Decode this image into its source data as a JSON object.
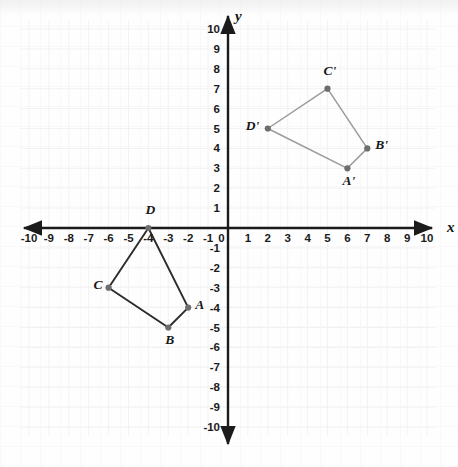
{
  "figure": {
    "kind": "coordinate-plane",
    "axis_labels": {
      "x": "x",
      "y": "y"
    },
    "x_ticks": [
      "-10",
      "-9",
      "-8",
      "-7",
      "-6",
      "-5",
      "-4",
      "-3",
      "-2",
      "-1",
      "0",
      "1",
      "2",
      "3",
      "4",
      "5",
      "6",
      "7",
      "8",
      "9",
      "10"
    ],
    "y_ticks": [
      "10",
      "9",
      "8",
      "7",
      "6",
      "5",
      "4",
      "3",
      "2",
      "1",
      "-1",
      "-2",
      "-3",
      "-4",
      "-5",
      "-6",
      "-7",
      "-8",
      "-9",
      "-10"
    ],
    "origin_label": "0",
    "colors": {
      "axis": "#1b1b1b",
      "preimage_edge": "#2b2b2b",
      "image_edge": "#9a9a9a",
      "vertex_dot": "#6d6d6d",
      "grid": "#f2f2f4",
      "text": "#161616"
    }
  },
  "chart_data": {
    "type": "scatter",
    "title": "",
    "xlabel": "x",
    "ylabel": "y",
    "xlim": [
      -10,
      10
    ],
    "ylim": [
      -10,
      10
    ],
    "grid": true,
    "legend": "none",
    "units_per_tick": 1,
    "series": [
      {
        "name": "ABCD",
        "role": "preimage",
        "edge_color": "#2b2b2b",
        "closed": true,
        "points": [
          {
            "label": "A",
            "x": -2,
            "y": -4,
            "label_dx": 7,
            "label_dy": -4
          },
          {
            "label": "B",
            "x": -3,
            "y": -5,
            "label_dx": -3,
            "label_dy": 11
          },
          {
            "label": "C",
            "x": -6,
            "y": -3,
            "label_dx": -15,
            "label_dy": -4
          },
          {
            "label": "D",
            "x": -4,
            "y": 0,
            "label_dx": -3,
            "label_dy": -19
          }
        ]
      },
      {
        "name": "A'B'C'D'",
        "role": "image",
        "edge_color": "#9a9a9a",
        "closed": true,
        "points": [
          {
            "label": "A'",
            "x": 6,
            "y": 3,
            "label_dx": -5,
            "label_dy": 12
          },
          {
            "label": "B'",
            "x": 7,
            "y": 4,
            "label_dx": 8,
            "label_dy": -4
          },
          {
            "label": "C'",
            "x": 5,
            "y": 7,
            "label_dx": -4,
            "label_dy": -19
          },
          {
            "label": "D'",
            "x": 2,
            "y": 5,
            "label_dx": -22,
            "label_dy": -4
          }
        ]
      }
    ]
  }
}
